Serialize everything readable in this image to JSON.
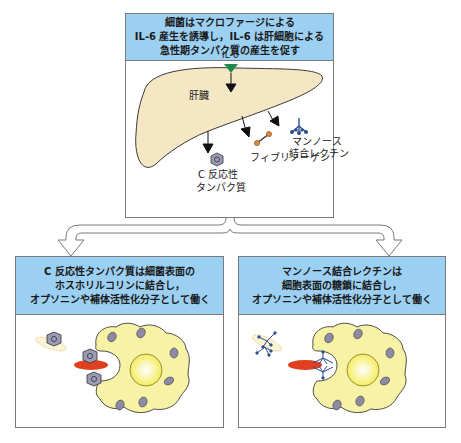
{
  "top_panel": {
    "header_lines": [
      "細菌はマクロファージによる",
      "IL-6 産生を誘導し，IL-6 は肝細胞による",
      "急性期タンパク質の産生を促す"
    ],
    "labels": {
      "il6": "IL-6",
      "liver": "肝臓",
      "mbl_line1": "マンノース",
      "mbl_line2": "結合レクチン",
      "fibrinogen": "フィブリノーゲン",
      "crp_line1": "C 反応性",
      "crp_line2": "タンパク質"
    }
  },
  "left_panel": {
    "header_lines": [
      "C 反応性タンパク質は細菌表面の",
      "ホスホリルコリンに結合し，",
      "オプソニンや補体活性化分子として働く"
    ]
  },
  "right_panel": {
    "header_lines": [
      "マンノース結合レクチンは",
      "細胞表面の糖鎖に結合し，",
      "オプソニンや補体活性化分子として働く"
    ]
  },
  "colors": {
    "header_bg": "#9cd0f3",
    "liver_fill": "#f5e6c4",
    "il6_triangle": "#1f8a4c",
    "macrophage_fill": "#f7f2a6",
    "bacterium_red": "#e0401f",
    "crp_hex": "#9a9ab5",
    "mbl_blue": "#2c4f8f",
    "fibrinogen_orange": "#d98a3a"
  }
}
